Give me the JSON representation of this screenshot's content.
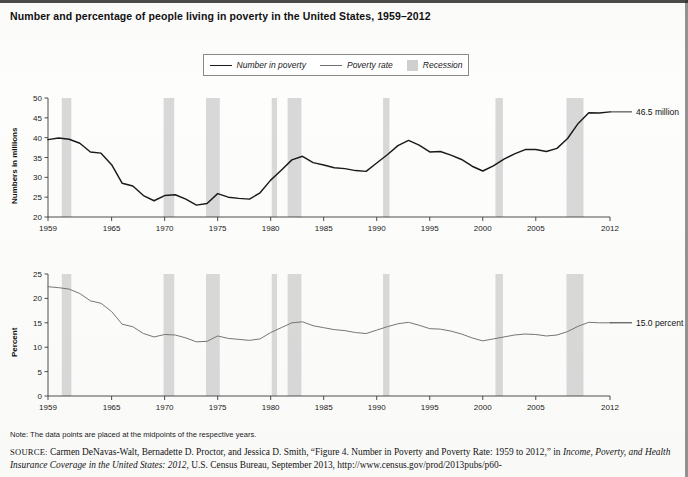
{
  "title": "Number and percentage of people living in poverty in the United States, 1959–2012",
  "legend": {
    "items": [
      {
        "label": "Number in poverty",
        "marker": "line-dark",
        "color": "#1a1a1a"
      },
      {
        "label": "Poverty rate",
        "marker": "line-light",
        "color": "#6f6f6f"
      },
      {
        "label": "Recession",
        "marker": "swatch",
        "color": "#cfcfcf"
      }
    ]
  },
  "note": "Note: The data points are placed at the midpoints of the respective years.",
  "source": {
    "prefix": "SOURCE:",
    "line1_a": " Carmen DeNavas-Walt, Bernadette D. Proctor, and Jessica D. Smith, “Figure 4. Number in Poverty and Poverty Rate: 1959 to 2012,” in ",
    "line1_italic": "Income,",
    "line2_italic": "Poverty, and Health Insurance Coverage in the United States: 2012",
    "line2_b": ", U.S. Census Bureau, September 2013, http://www.census.gov/prod/2013pubs/p60-"
  },
  "annotations": {
    "top": "46.5 million",
    "bottom": "15.0 percent"
  },
  "chart_data": [
    {
      "type": "line",
      "id": "number-in-poverty",
      "title": "Number in poverty",
      "xlabel": "",
      "ylabel": "Numbers in millions",
      "xlim": [
        1959,
        2012
      ],
      "ylim": [
        20,
        50
      ],
      "yticks": [
        20,
        25,
        30,
        35,
        40,
        45,
        50
      ],
      "xticks": [
        1959,
        1965,
        1970,
        1975,
        1980,
        1985,
        1990,
        1995,
        2000,
        2005,
        2012
      ],
      "grid": false,
      "legend_position": "top-center",
      "series": [
        {
          "name": "Number in poverty",
          "color": "#1a1a1a",
          "x": [
            1959,
            1960,
            1961,
            1962,
            1963,
            1964,
            1965,
            1966,
            1967,
            1968,
            1969,
            1970,
            1971,
            1972,
            1973,
            1974,
            1975,
            1976,
            1977,
            1978,
            1979,
            1980,
            1981,
            1982,
            1983,
            1984,
            1985,
            1986,
            1987,
            1988,
            1989,
            1990,
            1991,
            1992,
            1993,
            1994,
            1995,
            1996,
            1997,
            1998,
            1999,
            2000,
            2001,
            2002,
            2003,
            2004,
            2005,
            2006,
            2007,
            2008,
            2009,
            2010,
            2011,
            2012
          ],
          "values": [
            39.5,
            39.9,
            39.6,
            38.6,
            36.4,
            36.1,
            33.2,
            28.5,
            27.8,
            25.4,
            24.1,
            25.4,
            25.6,
            24.5,
            23.0,
            23.4,
            25.9,
            25.0,
            24.7,
            24.5,
            26.1,
            29.3,
            31.8,
            34.4,
            35.3,
            33.7,
            33.1,
            32.4,
            32.2,
            31.7,
            31.5,
            33.6,
            35.7,
            38.0,
            39.3,
            38.1,
            36.4,
            36.5,
            35.6,
            34.5,
            32.8,
            31.6,
            32.9,
            34.6,
            35.9,
            37.0,
            37.0,
            36.5,
            37.3,
            39.8,
            43.6,
            46.3,
            46.2,
            46.5
          ],
          "units": "millions"
        }
      ],
      "recessions": [
        {
          "start": 1960.3,
          "end": 1961.2
        },
        {
          "start": 1969.9,
          "end": 1970.9
        },
        {
          "start": 1973.9,
          "end": 1975.2
        },
        {
          "start": 1980.1,
          "end": 1980.6
        },
        {
          "start": 1981.6,
          "end": 1982.9
        },
        {
          "start": 1990.6,
          "end": 1991.2
        },
        {
          "start": 2001.2,
          "end": 2001.9
        },
        {
          "start": 2007.9,
          "end": 2009.5
        }
      ],
      "end_label": {
        "value": 46.5,
        "text": "46.5 million",
        "year": 2012
      }
    },
    {
      "type": "line",
      "id": "poverty-rate",
      "title": "Poverty rate",
      "xlabel": "",
      "ylabel": "Percent",
      "xlim": [
        1959,
        2012
      ],
      "ylim": [
        0,
        25
      ],
      "yticks": [
        0,
        5,
        10,
        15,
        20,
        25
      ],
      "xticks": [
        1959,
        1965,
        1970,
        1975,
        1980,
        1985,
        1990,
        1995,
        2000,
        2005,
        2012
      ],
      "grid": false,
      "series": [
        {
          "name": "Poverty rate",
          "color": "#6f6f6f",
          "x": [
            1959,
            1960,
            1961,
            1962,
            1963,
            1964,
            1965,
            1966,
            1967,
            1968,
            1969,
            1970,
            1971,
            1972,
            1973,
            1974,
            1975,
            1976,
            1977,
            1978,
            1979,
            1980,
            1981,
            1982,
            1983,
            1984,
            1985,
            1986,
            1987,
            1988,
            1989,
            1990,
            1991,
            1992,
            1993,
            1994,
            1995,
            1996,
            1997,
            1998,
            1999,
            2000,
            2001,
            2002,
            2003,
            2004,
            2005,
            2006,
            2007,
            2008,
            2009,
            2010,
            2011,
            2012
          ],
          "values": [
            22.4,
            22.2,
            21.9,
            21.0,
            19.5,
            19.0,
            17.3,
            14.7,
            14.2,
            12.8,
            12.1,
            12.6,
            12.5,
            11.9,
            11.1,
            11.2,
            12.3,
            11.8,
            11.6,
            11.4,
            11.7,
            13.0,
            14.0,
            15.0,
            15.2,
            14.4,
            14.0,
            13.6,
            13.4,
            13.0,
            12.8,
            13.5,
            14.2,
            14.8,
            15.1,
            14.5,
            13.8,
            13.7,
            13.3,
            12.7,
            11.9,
            11.3,
            11.7,
            12.1,
            12.5,
            12.7,
            12.6,
            12.3,
            12.5,
            13.2,
            14.3,
            15.1,
            15.0,
            15.0
          ],
          "units": "percent"
        }
      ],
      "recessions": [
        {
          "start": 1960.3,
          "end": 1961.2
        },
        {
          "start": 1969.9,
          "end": 1970.9
        },
        {
          "start": 1973.9,
          "end": 1975.2
        },
        {
          "start": 1980.1,
          "end": 1980.6
        },
        {
          "start": 1981.6,
          "end": 1982.9
        },
        {
          "start": 1990.6,
          "end": 1991.2
        },
        {
          "start": 2001.2,
          "end": 2001.9
        },
        {
          "start": 2007.9,
          "end": 2009.5
        }
      ],
      "end_label": {
        "value": 15.0,
        "text": "15.0 percent",
        "year": 2012
      }
    }
  ]
}
